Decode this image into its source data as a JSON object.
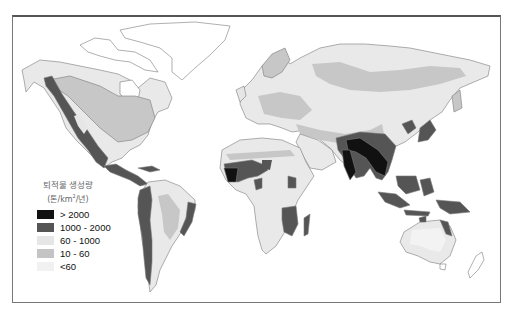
{
  "map": {
    "type": "choropleth world map",
    "legend": {
      "title": "퇴적물 생성량",
      "unit_prefix": "(톤/km",
      "unit_sup": "2",
      "unit_suffix": "/년)",
      "items": [
        {
          "label": "> 2000",
          "color": "#111111"
        },
        {
          "label": "1000 - 2000",
          "color": "#555555"
        },
        {
          "label": "60 - 1000",
          "color": "#e6e6e6"
        },
        {
          "label": "10 - 60",
          "color": "#c4c4c4"
        },
        {
          "label": "<60",
          "color": "#f1f1f1"
        }
      ]
    },
    "colors": {
      "ocean": "#ffffff",
      "outline": "#777777",
      "frame": "#666666"
    }
  }
}
